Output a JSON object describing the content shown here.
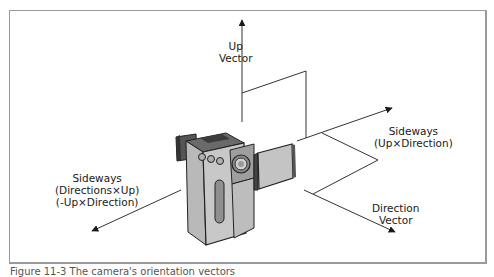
{
  "figure": {
    "labels": {
      "up": {
        "line1": "Up",
        "line2": "Vector"
      },
      "sideways_right": {
        "line1": "Sideways",
        "line2": "(Up×Direction)"
      },
      "direction": {
        "line1": "Direction",
        "line2": "Vector"
      },
      "sideways_left": {
        "line1": "Sideways",
        "line2": "(Directions×Up)",
        "line3": "(-Up×Direction)"
      }
    },
    "caption": "Figure 11-3  The camera's orientation vectors"
  },
  "colors": {
    "line": "#333333",
    "frame": "#9a9a9a",
    "camera_body": "#c8c8c8",
    "camera_dark": "#3a3a3a"
  }
}
